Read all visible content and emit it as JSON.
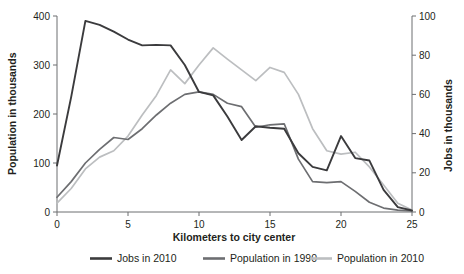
{
  "chart_data": {
    "type": "line",
    "title": "",
    "subtitle": "",
    "xlabel": "Kilometers to city center",
    "ylabel": "Population in thousands",
    "y2label": "Jobs in thousands",
    "xlim": [
      0,
      25
    ],
    "ylim": [
      0,
      400
    ],
    "y2lim": [
      0,
      100
    ],
    "grid": false,
    "legend_position": "bottom",
    "xticks": [
      0,
      5,
      10,
      15,
      20,
      25
    ],
    "yticks": [
      0,
      100,
      200,
      300,
      400
    ],
    "y2ticks": [
      0,
      20,
      40,
      60,
      80,
      100
    ],
    "x": [
      0,
      1,
      2,
      3,
      4,
      5,
      6,
      7,
      8,
      9,
      10,
      11,
      12,
      13,
      14,
      15,
      16,
      17,
      18,
      19,
      20,
      21,
      22,
      23,
      24,
      25
    ],
    "series": [
      {
        "name": "Jobs in 2010",
        "axis": "right",
        "unit": "thousands",
        "color": "#3b3b3d",
        "values_left_scale": [
          95,
          235,
          390,
          382,
          368,
          352,
          340,
          341,
          340,
          300,
          245,
          238,
          195,
          147,
          175,
          172,
          170,
          120,
          92,
          85,
          155,
          110,
          105,
          45,
          10,
          3
        ],
        "values": [
          23.8,
          58.8,
          97.5,
          95.5,
          92.0,
          88.0,
          85.0,
          85.3,
          85.0,
          75.0,
          61.3,
          59.5,
          48.8,
          36.8,
          43.8,
          43.0,
          42.5,
          30.0,
          23.0,
          21.3,
          38.8,
          27.5,
          26.3,
          11.3,
          2.5,
          0.8
        ]
      },
      {
        "name": "Population in 1990",
        "axis": "left",
        "unit": "thousands",
        "color": "#6d6e71",
        "values": [
          30,
          62,
          100,
          128,
          152,
          148,
          170,
          198,
          222,
          240,
          245,
          240,
          222,
          215,
          173,
          178,
          180,
          108,
          62,
          60,
          62,
          42,
          20,
          8,
          4,
          2
        ]
      },
      {
        "name": "Population in 2010",
        "axis": "left",
        "unit": "thousands",
        "color": "#bcbec0",
        "values": [
          18,
          48,
          88,
          112,
          125,
          155,
          198,
          238,
          290,
          262,
          300,
          335,
          312,
          290,
          268,
          295,
          285,
          240,
          170,
          125,
          118,
          122,
          92,
          55,
          18,
          4
        ]
      }
    ]
  },
  "axes": {
    "left": {
      "title": "Population in thousands",
      "tick_labels": [
        "0",
        "100",
        "200",
        "300",
        "400"
      ]
    },
    "right": {
      "title": "Jobs in thousands",
      "tick_labels": [
        "0",
        "20",
        "40",
        "60",
        "80",
        "100"
      ]
    },
    "bottom": {
      "title": "Kilometers to city center",
      "tick_labels": [
        "0",
        "5",
        "10",
        "15",
        "20",
        "25"
      ]
    }
  },
  "legend": {
    "items": [
      {
        "label": "Jobs in 2010",
        "color": "#3b3b3d"
      },
      {
        "label": "Population in 1990",
        "color": "#6d6e71"
      },
      {
        "label": "Population in 2010",
        "color": "#bcbec0"
      }
    ]
  }
}
